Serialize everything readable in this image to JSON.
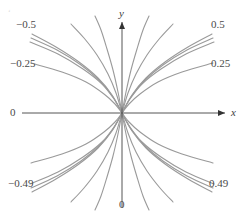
{
  "figure": {
    "background": "#ffffff",
    "curve_color": "#9a9a9a",
    "axis_color": "#555555",
    "label_color": "#4a4a4a"
  },
  "axes": {
    "x_axis_label": "x",
    "y_axis_label": "y",
    "origin_left_label": "0",
    "origin_bottom_label": "0"
  },
  "labels": {
    "top_left": "−0.5",
    "top_right": "0.5",
    "mid_left": "−0.25",
    "mid_right": "0.25",
    "bottom_left": "−0.49",
    "bottom_right": "0.49"
  },
  "corner": {
    "artifact": "‘"
  },
  "chart_data": {
    "type": "line",
    "title": "",
    "xlabel": "x",
    "ylabel": "y",
    "grid": false,
    "legend": "endpoint-labels",
    "xlim": [
      -1,
      1
    ],
    "ylim": [
      -1,
      1
    ],
    "origin_px": [
      122,
      113
    ],
    "endpoint_labels": [
      {
        "text": "−0.5",
        "position": "top-left",
        "px": [
          22,
          25
        ]
      },
      {
        "text": "0.5",
        "position": "top-right",
        "px": [
          212,
          25
        ]
      },
      {
        "text": "−0.25",
        "position": "mid-left",
        "px": [
          16,
          63
        ]
      },
      {
        "text": "0.25",
        "position": "mid-right",
        "px": [
          212,
          63
        ]
      },
      {
        "text": "−0.49",
        "position": "bottom-left",
        "px": [
          14,
          182
        ]
      },
      {
        "text": "0.49",
        "position": "bottom-right",
        "px": [
          210,
          182
        ]
      },
      {
        "text": "0",
        "position": "x-axis-left",
        "px": [
          25,
          108
        ]
      },
      {
        "text": "0",
        "position": "y-axis-bottom",
        "px": [
          119,
          200
        ]
      }
    ],
    "series": [
      {
        "name": "c=0.5 upper-right",
        "points": [
          [
            122,
            113
          ],
          [
            132,
            95
          ],
          [
            146,
            78
          ],
          [
            165,
            62
          ],
          [
            188,
            47
          ],
          [
            212,
            34
          ]
        ]
      },
      {
        "name": "c=0.49 upper-right",
        "points": [
          [
            122,
            113
          ],
          [
            131,
            97
          ],
          [
            144,
            81
          ],
          [
            163,
            65
          ],
          [
            187,
            50
          ],
          [
            213,
            38
          ]
        ]
      },
      {
        "name": "c=0.45 upper-right",
        "points": [
          [
            122,
            113
          ],
          [
            130,
            99
          ],
          [
            142,
            84
          ],
          [
            161,
            69
          ],
          [
            186,
            54
          ],
          [
            214,
            42
          ]
        ]
      },
      {
        "name": "c=0.25 upper-right",
        "points": [
          [
            122,
            113
          ],
          [
            129,
            104
          ],
          [
            140,
            94
          ],
          [
            158,
            82
          ],
          [
            182,
            72
          ],
          [
            213,
            63
          ]
        ]
      },
      {
        "name": "steep-a upper-right",
        "points": [
          [
            122,
            113
          ],
          [
            126,
            92
          ],
          [
            131,
            70
          ],
          [
            137,
            49
          ],
          [
            143,
            30
          ],
          [
            149,
            16
          ]
        ]
      },
      {
        "name": "steep-b upper-right",
        "points": [
          [
            122,
            113
          ],
          [
            128,
            93
          ],
          [
            136,
            74
          ],
          [
            147,
            55
          ],
          [
            160,
            38
          ],
          [
            173,
            24
          ]
        ]
      },
      {
        "name": "c=0.5 upper-left",
        "points": [
          [
            122,
            113
          ],
          [
            112,
            95
          ],
          [
            98,
            78
          ],
          [
            79,
            62
          ],
          [
            56,
            47
          ],
          [
            32,
            34
          ]
        ]
      },
      {
        "name": "c=0.49 upper-left",
        "points": [
          [
            122,
            113
          ],
          [
            113,
            97
          ],
          [
            100,
            81
          ],
          [
            81,
            65
          ],
          [
            57,
            50
          ],
          [
            31,
            38
          ]
        ]
      },
      {
        "name": "c=0.45 upper-left",
        "points": [
          [
            122,
            113
          ],
          [
            114,
            99
          ],
          [
            102,
            84
          ],
          [
            83,
            69
          ],
          [
            58,
            54
          ],
          [
            30,
            42
          ]
        ]
      },
      {
        "name": "c=0.25 upper-left",
        "points": [
          [
            122,
            113
          ],
          [
            115,
            104
          ],
          [
            104,
            94
          ],
          [
            86,
            82
          ],
          [
            62,
            72
          ],
          [
            31,
            63
          ]
        ]
      },
      {
        "name": "steep-a upper-left",
        "points": [
          [
            122,
            113
          ],
          [
            118,
            92
          ],
          [
            113,
            70
          ],
          [
            107,
            49
          ],
          [
            101,
            30
          ],
          [
            95,
            16
          ]
        ]
      },
      {
        "name": "steep-b upper-left",
        "points": [
          [
            122,
            113
          ],
          [
            116,
            93
          ],
          [
            108,
            74
          ],
          [
            97,
            55
          ],
          [
            84,
            38
          ],
          [
            71,
            24
          ]
        ]
      },
      {
        "name": "c=0.5 lower-right",
        "points": [
          [
            122,
            113
          ],
          [
            132,
            131
          ],
          [
            146,
            148
          ],
          [
            165,
            164
          ],
          [
            188,
            179
          ],
          [
            212,
            192
          ]
        ]
      },
      {
        "name": "c=0.49 lower-right",
        "points": [
          [
            122,
            113
          ],
          [
            131,
            129
          ],
          [
            144,
            145
          ],
          [
            163,
            161
          ],
          [
            187,
            176
          ],
          [
            213,
            188
          ]
        ]
      },
      {
        "name": "c=0.45 lower-right",
        "points": [
          [
            122,
            113
          ],
          [
            130,
            127
          ],
          [
            142,
            142
          ],
          [
            161,
            157
          ],
          [
            186,
            172
          ],
          [
            214,
            184
          ]
        ]
      },
      {
        "name": "c=0.25 lower-right",
        "points": [
          [
            122,
            113
          ],
          [
            129,
            122
          ],
          [
            140,
            132
          ],
          [
            158,
            144
          ],
          [
            182,
            154
          ],
          [
            213,
            163
          ]
        ]
      },
      {
        "name": "steep-a lower-right",
        "points": [
          [
            122,
            113
          ],
          [
            126,
            134
          ],
          [
            131,
            156
          ],
          [
            137,
            177
          ],
          [
            143,
            196
          ],
          [
            149,
            210
          ]
        ]
      },
      {
        "name": "steep-b lower-right",
        "points": [
          [
            122,
            113
          ],
          [
            128,
            133
          ],
          [
            136,
            152
          ],
          [
            147,
            171
          ],
          [
            160,
            188
          ],
          [
            173,
            202
          ]
        ]
      },
      {
        "name": "c=0.5 lower-left",
        "points": [
          [
            122,
            113
          ],
          [
            112,
            131
          ],
          [
            98,
            148
          ],
          [
            79,
            164
          ],
          [
            56,
            179
          ],
          [
            32,
            192
          ]
        ]
      },
      {
        "name": "c=0.49 lower-left",
        "points": [
          [
            122,
            113
          ],
          [
            113,
            129
          ],
          [
            100,
            145
          ],
          [
            81,
            161
          ],
          [
            57,
            176
          ],
          [
            31,
            188
          ]
        ]
      },
      {
        "name": "c=0.45 lower-left",
        "points": [
          [
            122,
            113
          ],
          [
            114,
            127
          ],
          [
            102,
            142
          ],
          [
            83,
            157
          ],
          [
            58,
            172
          ],
          [
            30,
            184
          ]
        ]
      },
      {
        "name": "c=0.25 lower-left",
        "points": [
          [
            122,
            113
          ],
          [
            115,
            122
          ],
          [
            104,
            132
          ],
          [
            86,
            144
          ],
          [
            62,
            154
          ],
          [
            31,
            163
          ]
        ]
      },
      {
        "name": "steep-a lower-left",
        "points": [
          [
            122,
            113
          ],
          [
            118,
            134
          ],
          [
            113,
            156
          ],
          [
            107,
            177
          ],
          [
            101,
            196
          ],
          [
            95,
            210
          ]
        ]
      },
      {
        "name": "steep-b lower-left",
        "points": [
          [
            122,
            113
          ],
          [
            116,
            133
          ],
          [
            108,
            152
          ],
          [
            97,
            171
          ],
          [
            84,
            188
          ],
          [
            71,
            202
          ]
        ]
      }
    ]
  }
}
